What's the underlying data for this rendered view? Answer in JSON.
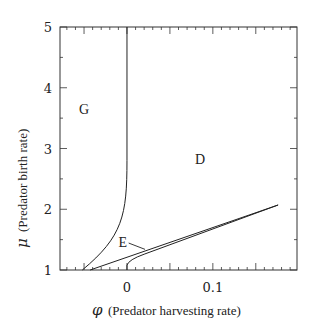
{
  "chart_data": {
    "type": "line",
    "title": "",
    "xlabel_symbol": "φ",
    "xlabel": "(Predator harvesting rate)",
    "ylabel_symbol": "μ",
    "ylabel": "(Predator birth rate)",
    "xlim": [
      -0.078,
      0.198
    ],
    "ylim": [
      1,
      5
    ],
    "x_ticks_labeled": [
      {
        "value": 0,
        "label": "0"
      },
      {
        "value": 0.1,
        "label": "0.1"
      }
    ],
    "y_ticks_labeled": [
      {
        "value": 1,
        "label": "1"
      },
      {
        "value": 2,
        "label": "2"
      },
      {
        "value": 3,
        "label": "3"
      },
      {
        "value": 4,
        "label": "4"
      },
      {
        "value": 5,
        "label": "5"
      }
    ],
    "grid": false,
    "legend": null,
    "series": [
      {
        "name": "G/D boundary",
        "points": [
          [
            -0.052,
            1.0
          ],
          [
            -0.035,
            1.2
          ],
          [
            -0.02,
            1.45
          ],
          [
            -0.01,
            1.7
          ],
          [
            -0.004,
            2.0
          ],
          [
            -0.001,
            2.4
          ],
          [
            0.0,
            2.8
          ],
          [
            0.0,
            5.0
          ]
        ]
      },
      {
        "name": "E lower boundary",
        "points": [
          [
            -0.043,
            1.0
          ],
          [
            0.176,
            2.07
          ]
        ]
      },
      {
        "name": "E upper boundary",
        "points": [
          [
            0.0,
            1.12
          ],
          [
            0.0,
            1.05
          ],
          [
            0.003,
            1.15
          ],
          [
            0.02,
            1.26
          ],
          [
            0.06,
            1.47
          ],
          [
            0.1,
            1.68
          ],
          [
            0.176,
            2.07
          ]
        ]
      }
    ],
    "annotations": [
      {
        "text": "G",
        "x": -0.05,
        "y": 3.65
      },
      {
        "text": "D",
        "x": 0.085,
        "y": 2.82
      },
      {
        "text": "E",
        "x": -0.005,
        "y": 1.46,
        "arrow_to": [
          0.021,
          1.34
        ]
      }
    ]
  }
}
